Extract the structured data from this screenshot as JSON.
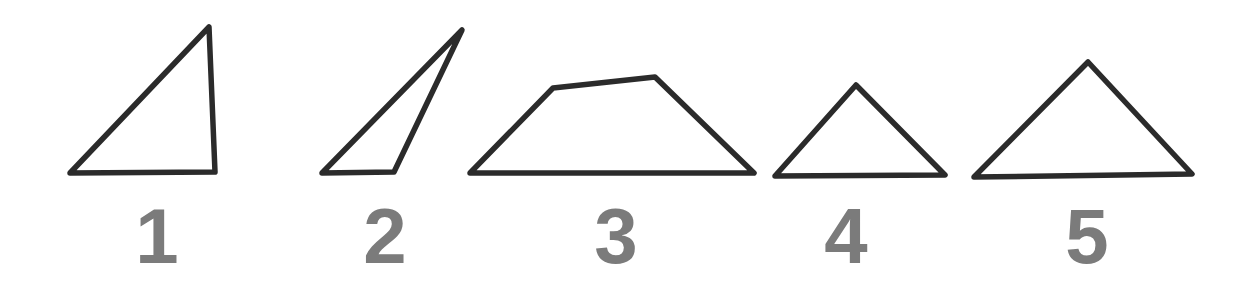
{
  "figure": {
    "background_color": "#ffffff",
    "stroke_color": "#2b2b2b",
    "label_color": "#7b7b7b",
    "stroke_width": 5.5,
    "width": 1259,
    "height": 292
  },
  "shapes": [
    {
      "label": "1",
      "kind": "right-triangle",
      "points": "209,27 215,172 70,173",
      "label_x": 157,
      "label_y": 197
    },
    {
      "label": "2",
      "kind": "narrow-scalene-triangle",
      "points": "462,30 394,172 322,173",
      "label_x": 385,
      "label_y": 197
    },
    {
      "label": "3",
      "kind": "trapezoid",
      "points": "553,88 655,77 754,173 470,173",
      "label_x": 616,
      "label_y": 197
    },
    {
      "label": "4",
      "kind": "isosceles-triangle",
      "points": "856,85 945,175 775,176",
      "label_x": 846,
      "label_y": 197
    },
    {
      "label": "5",
      "kind": "wide-isosceles-triangle",
      "points": "1088,62 1192,174 974,177",
      "label_x": 1087,
      "label_y": 197
    }
  ]
}
